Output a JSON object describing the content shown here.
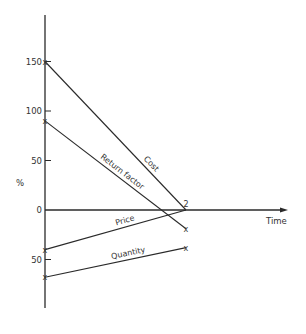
{
  "chart_data": {
    "type": "line",
    "title": "",
    "xlabel": "Time",
    "ylabel": "%",
    "ylim": [
      -100,
      195
    ],
    "yticks": [
      150,
      100,
      50,
      0,
      -50
    ],
    "ytick_labels": [
      "150",
      "100",
      "50",
      "0",
      "50"
    ],
    "grid": false,
    "legend": "inline labels on lines",
    "x": [
      0,
      1
    ],
    "series": [
      {
        "name": "Cost",
        "values": [
          150,
          0
        ]
      },
      {
        "name": "Return factor",
        "values": [
          90,
          -19
        ]
      },
      {
        "name": "Price",
        "values": [
          -40,
          0
        ]
      },
      {
        "name": "Quantity",
        "values": [
          -68,
          -38
        ]
      }
    ],
    "annotations": [
      {
        "text": "2",
        "x": 1,
        "y": 0,
        "note": "two lines meet at this point"
      },
      {
        "text": "x",
        "x": 1,
        "y": -19
      },
      {
        "text": "x",
        "x": 1,
        "y": -38
      }
    ]
  }
}
